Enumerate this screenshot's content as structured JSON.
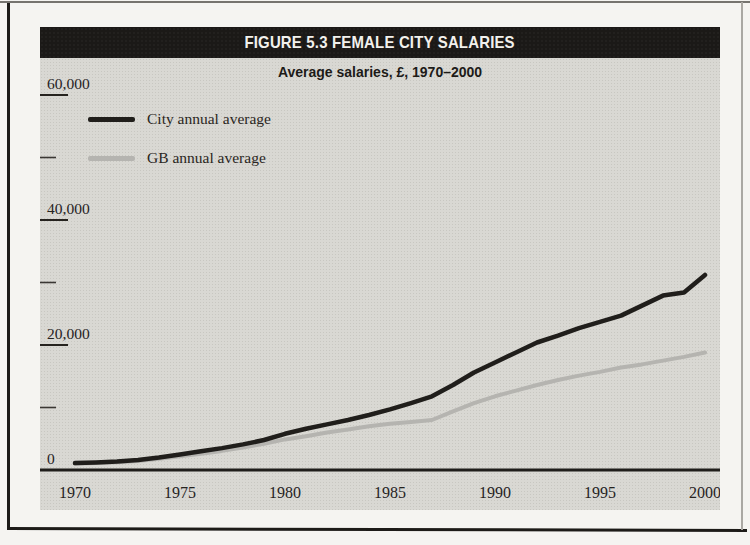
{
  "figure": {
    "title": "FIGURE 5.3 FEMALE CITY SALARIES",
    "subtitle": "Average salaries, £, 1970–2000"
  },
  "legend": [
    {
      "label": "City annual average",
      "color": "#201e1b"
    },
    {
      "label": "GB annual average",
      "color": "#b5b4b0"
    }
  ],
  "colors": {
    "page_background": "#f5f4f1",
    "chart_background": "#d9d8d3",
    "title_bar": "#1b1917",
    "title_text": "#f2f1ed",
    "axis": "#26231f",
    "city_line": "#201e1b",
    "gb_line": "#b5b4b0"
  },
  "chart_data": {
    "type": "line",
    "title": "FIGURE 5.3 FEMALE CITY SALARIES",
    "subtitle": "Average salaries, £, 1970–2000",
    "xlabel": "",
    "ylabel": "Average salary (£)",
    "grid": false,
    "legend_position": "upper-left",
    "xlim": [
      1970,
      2000
    ],
    "ylim": [
      0,
      60000
    ],
    "x": [
      1970,
      1971,
      1972,
      1973,
      1974,
      1975,
      1976,
      1977,
      1978,
      1979,
      1980,
      1981,
      1982,
      1983,
      1984,
      1985,
      1986,
      1987,
      1988,
      1989,
      1990,
      1991,
      1992,
      1993,
      1994,
      1995,
      1996,
      1997,
      1998,
      1999,
      2000
    ],
    "series": [
      {
        "name": "City annual average",
        "color": "#201e1b",
        "values": [
          1100,
          1200,
          1350,
          1600,
          2000,
          2500,
          3000,
          3500,
          4100,
          4800,
          5800,
          6600,
          7300,
          8000,
          8800,
          9700,
          10700,
          11800,
          13600,
          15600,
          17200,
          18800,
          20400,
          21500,
          22700,
          23700,
          24700,
          26300,
          27900,
          28400,
          31200
        ]
      },
      {
        "name": "GB annual average",
        "color": "#b5b4b0",
        "values": [
          1000,
          1100,
          1250,
          1450,
          1800,
          2200,
          2600,
          3050,
          3600,
          4200,
          4900,
          5400,
          6000,
          6500,
          7000,
          7400,
          7700,
          8000,
          9400,
          10700,
          11800,
          12700,
          13600,
          14400,
          15100,
          15700,
          16400,
          16900,
          17500,
          18100,
          18800
        ]
      }
    ],
    "x_ticks": [
      1970,
      1975,
      1980,
      1985,
      1990,
      1995,
      2000
    ],
    "y_ticks_major": [
      {
        "value": 0,
        "label": "0"
      },
      {
        "value": 20000,
        "label": "20,000"
      },
      {
        "value": 40000,
        "label": "40,000"
      },
      {
        "value": 60000,
        "label": "60,000"
      }
    ],
    "y_ticks_minor": [
      10000,
      30000,
      50000
    ]
  }
}
